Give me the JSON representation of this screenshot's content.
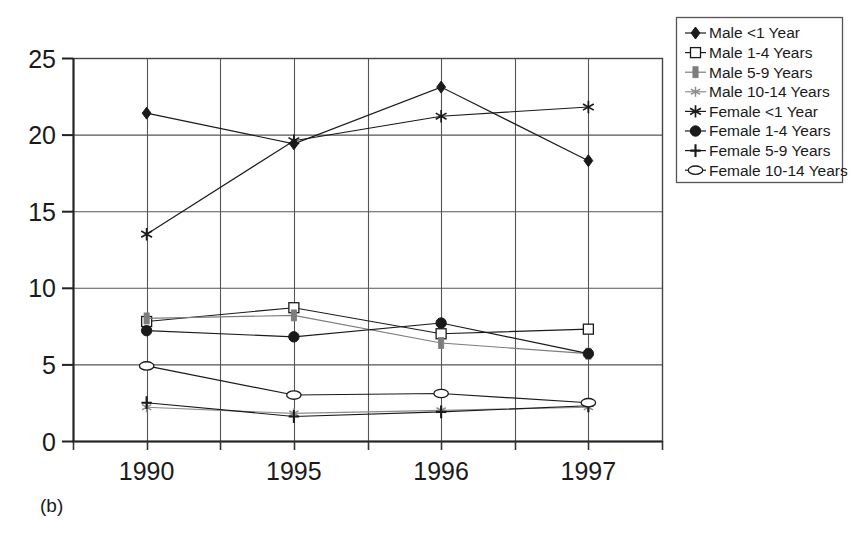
{
  "figure": {
    "caption": "(b)",
    "background": "#ffffff",
    "ink_color": "#1a1a1a"
  },
  "chart_data": {
    "type": "line",
    "title": "",
    "subtitle": "",
    "xlabel": "",
    "ylabel": "",
    "categories": [
      "1990",
      "1995",
      "1996",
      "1997"
    ],
    "x_tick_labels": [
      "1990",
      "1995",
      "1996",
      "1997"
    ],
    "y_tick_labels": [
      "0",
      "5",
      "10",
      "15",
      "20",
      "25"
    ],
    "y_ticks": [
      0,
      5,
      10,
      15,
      20,
      25
    ],
    "ylim": [
      0,
      25
    ],
    "grid": "both",
    "grid_vertical_count": 7,
    "legend_position": "right-top",
    "series": [
      {
        "name": "Male <1 Year",
        "marker": "filled-diamond",
        "color": "#1a1a1a",
        "values": [
          21.4,
          19.4,
          23.1,
          18.3
        ]
      },
      {
        "name": "Male 1-4 Years",
        "marker": "open-square",
        "color": "#1a1a1a",
        "values": [
          7.8,
          8.7,
          7.0,
          7.3
        ]
      },
      {
        "name": "Male 5-9 Years",
        "marker": "thick-bar",
        "color": "#7d7d7d",
        "values": [
          8.0,
          8.2,
          6.4,
          5.7
        ]
      },
      {
        "name": "Male 10-14 Years",
        "marker": "small-star",
        "color": "#8c8c8c",
        "values": [
          2.2,
          1.8,
          2.0,
          2.2
        ]
      },
      {
        "name": "Female <1 Year",
        "marker": "asterisk",
        "color": "#1a1a1a",
        "values": [
          13.5,
          19.6,
          21.2,
          21.8
        ]
      },
      {
        "name": "Female 1-4 Years",
        "marker": "filled-circle",
        "color": "#1a1a1a",
        "values": [
          7.2,
          6.8,
          7.7,
          5.7
        ]
      },
      {
        "name": "Female 5-9 Years",
        "marker": "plus",
        "color": "#1a1a1a",
        "values": [
          2.5,
          1.6,
          1.9,
          2.3
        ]
      },
      {
        "name": "Female 10-14 Years",
        "marker": "open-ellipse",
        "color": "#1a1a1a",
        "values": [
          4.9,
          3.0,
          3.1,
          2.5
        ]
      }
    ]
  }
}
